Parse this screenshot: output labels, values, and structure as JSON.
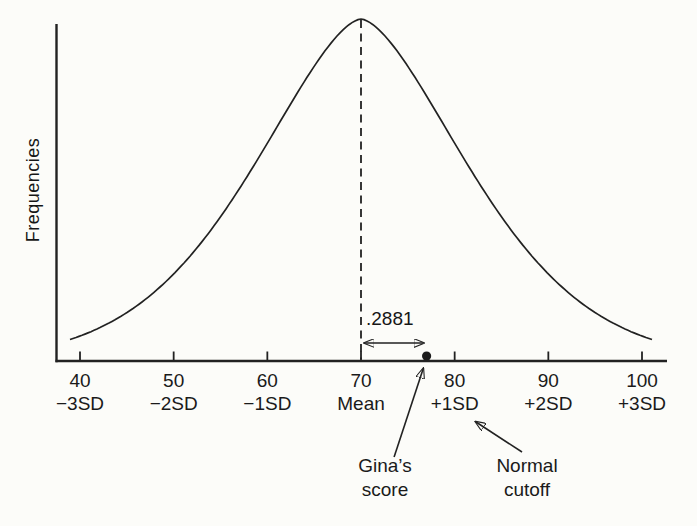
{
  "figure": {
    "ylabel": "Frequencies",
    "annotation_distance": ".2881",
    "gina_label_line1": "Gina’s",
    "gina_label_line2": "score",
    "cutoff_label_line1": "Normal",
    "cutoff_label_line2": "cutoff"
  },
  "colors": {
    "ink": "#222222",
    "background": "#fcfcf9"
  },
  "chart_data": {
    "type": "line",
    "subtype": "normal-distribution-curve",
    "title": "",
    "xlabel": "",
    "ylabel": "Frequencies",
    "x_ticks": [
      40,
      50,
      60,
      70,
      80,
      90,
      100
    ],
    "x_tick_sd_labels": [
      "−3SD",
      "−2SD",
      "−1SD",
      "Mean",
      "+1SD",
      "+2SD",
      "+3SD"
    ],
    "x_range_shown": [
      38.9,
      101.2
    ],
    "mean": 70,
    "sd": 10,
    "gina_score_approx": 77,
    "area_between_mean_and_gina_score": 0.2881,
    "annotations": [
      ".2881",
      "Gina’s score",
      "Normal cutoff"
    ],
    "normal_cutoff_at": "+1SD (80)",
    "grid": false,
    "legend": false
  }
}
